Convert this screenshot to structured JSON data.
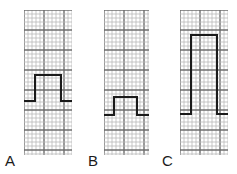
{
  "figure": {
    "background_color": "#ffffff",
    "width": 237,
    "height": 174
  },
  "grid": {
    "fine_line_color": "#b9b9b9",
    "bold_line_color": "#6e6e6e",
    "fine_spacing_px": 4,
    "bold_every": 5,
    "description": "ECG graph paper, 1 mm fine squares, 5 mm bold squares"
  },
  "trace": {
    "color": "#1a1a1a",
    "stroke_width": 2
  },
  "panels": [
    {
      "label": "A",
      "label_x": 5,
      "label_y": 153,
      "strip": {
        "x": 24,
        "y": 10,
        "width": 48,
        "height": 145
      },
      "pulse": {
        "baseline_y": 101,
        "top_y": 75,
        "left_x": 11,
        "right_x": 37,
        "lead_in_x": 0,
        "lead_out_x": 48,
        "height_units": 6.5,
        "width_units": 6.5
      }
    },
    {
      "label": "B",
      "label_x": 88,
      "label_y": 153,
      "strip": {
        "x": 104,
        "y": 10,
        "width": 45,
        "height": 145
      },
      "pulse": {
        "baseline_y": 115,
        "top_y": 97,
        "left_x": 10,
        "right_x": 33,
        "lead_in_x": 0,
        "lead_out_x": 45,
        "height_units": 4.5,
        "width_units": 5.75
      }
    },
    {
      "label": "C",
      "label_x": 162,
      "label_y": 153,
      "strip": {
        "x": 180,
        "y": 10,
        "width": 48,
        "height": 145
      },
      "pulse": {
        "baseline_y": 114,
        "top_y": 35,
        "left_x": 11,
        "right_x": 37,
        "lead_in_x": 0,
        "lead_out_x": 48,
        "height_units": 19.75,
        "width_units": 6.5
      }
    }
  ],
  "chart_data": {
    "type": "line",
    "xlabel": "",
    "ylabel": "",
    "series": [
      {
        "name": "A",
        "description": "Rectangular calibration pulse, moderate amplitude and width",
        "amplitude_small_squares": 6.5,
        "width_small_squares": 6.5,
        "x": [
          0,
          11,
          11,
          37,
          37,
          48
        ],
        "y": [
          101,
          101,
          75,
          75,
          101,
          101
        ]
      },
      {
        "name": "B",
        "description": "Rectangular calibration pulse, low amplitude, positioned low on strip",
        "amplitude_small_squares": 4.5,
        "width_small_squares": 5.75,
        "x": [
          0,
          10,
          10,
          33,
          33,
          45
        ],
        "y": [
          115,
          115,
          97,
          97,
          115,
          115
        ]
      },
      {
        "name": "C",
        "description": "Rectangular calibration pulse, tall amplitude",
        "amplitude_small_squares": 19.75,
        "width_small_squares": 6.5,
        "x": [
          0,
          11,
          11,
          37,
          37,
          48
        ],
        "y": [
          114,
          114,
          35,
          35,
          114,
          114
        ]
      }
    ],
    "legend": [
      "A",
      "B",
      "C"
    ],
    "grid": true
  }
}
